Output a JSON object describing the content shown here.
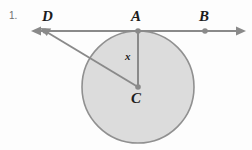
{
  "figure": {
    "problem_number": "1.",
    "type": "circle-tangent-geometry-diagram",
    "background_color": "#fdfdfd",
    "stroke_color": "#8a8a8a",
    "circle_fill_color": "#dcdcdc",
    "circle_stroke_color": "#909090",
    "label_color": "#1c1c1c",
    "labels": {
      "D": "D",
      "A": "A",
      "B": "B",
      "C": "C",
      "x": "x"
    },
    "points": {
      "D": {
        "x": 45,
        "y": 31,
        "name": "D",
        "on": "tangent-line"
      },
      "A": {
        "x": 138,
        "y": 31,
        "name": "A",
        "on": "tangent-point"
      },
      "B": {
        "x": 205,
        "y": 31,
        "name": "B",
        "on": "tangent-line"
      },
      "C": {
        "x": 138,
        "y": 87,
        "name": "C",
        "on": "circle-center"
      }
    },
    "circle": {
      "center_x": 138,
      "center_y": 87,
      "radius": 56
    },
    "tangent_line": {
      "y": 31,
      "left_arrow_tip_x": 31,
      "right_arrow_tip_x": 246,
      "double_headed": true
    },
    "segments": [
      {
        "name": "segment-DC",
        "from": "D",
        "to": "C",
        "label": ""
      },
      {
        "name": "segment-AC",
        "from": "A",
        "to": "C",
        "label": "x"
      }
    ]
  }
}
